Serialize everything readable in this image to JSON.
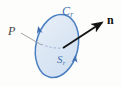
{
  "figure": {
    "background_color": "#fdfdfb",
    "labels": {
      "curve": {
        "base": "C",
        "subscript": "r",
        "text": "C r",
        "color": "#3f6fb0",
        "name": "boundary-curve-label"
      },
      "surface": {
        "base": "S",
        "subscript": "r",
        "text": "S r",
        "color": "#3f6fb0",
        "name": "surface-region-label"
      },
      "point": {
        "base": "P",
        "text": "P",
        "color": "#444444",
        "name": "point-label"
      },
      "normal": {
        "base": "n",
        "text": "n",
        "color": "#111111",
        "name": "normal-vector-label"
      }
    },
    "colors": {
      "disk_fill": "#dde8f4",
      "disk_fill_light": "#eaf1f9",
      "disk_stroke": "#4a7fc1",
      "arrowhead_blue": "#3f6fb0",
      "normal_arrow": "#141414",
      "leader_line": "#8d8d8d",
      "radius_dash": "#8fa8c6"
    },
    "geometry": {
      "disk_center_x": 57,
      "disk_center_y": 46,
      "disk_radius_x": 21,
      "disk_radius_y": 32,
      "disk_rotation_deg": 13,
      "normal_arrow_start_x": 63,
      "normal_arrow_start_y": 48,
      "normal_arrow_end_x": 104,
      "normal_arrow_end_y": 21,
      "leader_start_x": 21,
      "leader_start_y": 33,
      "leader_end_x": 41,
      "leader_end_y": 45,
      "radius_dash_start_x": 41,
      "radius_dash_start_y": 44,
      "radius_dash_end_x": 63,
      "radius_dash_end_y": 48
    },
    "orientation_arrowheads": [
      {
        "name": "circulation-arrowhead-left",
        "x": 39,
        "y": 30,
        "angle_deg": -76
      },
      {
        "name": "circulation-arrowhead-right",
        "x": 75,
        "y": 58,
        "angle_deg": 100
      }
    ]
  }
}
